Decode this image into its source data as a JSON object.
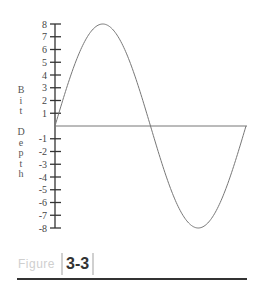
{
  "chart_data": {
    "type": "line",
    "title": "",
    "xlabel": "",
    "ylabel": "Bit Depth",
    "ylim": [
      -8,
      8
    ],
    "yticks": [
      8,
      7,
      6,
      5,
      4,
      3,
      2,
      1,
      -1,
      -2,
      -3,
      -4,
      -5,
      -6,
      -7,
      -8
    ],
    "grid": false,
    "legend": null,
    "series": [
      {
        "name": "sine wave",
        "description": "One full cycle of a sine wave with amplitude 8",
        "x": [
          0,
          0.125,
          0.25,
          0.375,
          0.5,
          0.625,
          0.75,
          0.875,
          1.0
        ],
        "values": [
          0,
          5.66,
          8,
          5.66,
          0,
          -5.66,
          -8,
          -5.66,
          0
        ]
      }
    ],
    "baseline": 0,
    "colors": {
      "wave": "#777777",
      "axis": "#333333",
      "baseline": "#777777"
    }
  },
  "axis": {
    "ylabel_letters": [
      "B",
      "i",
      "t",
      " ",
      "D",
      "e",
      "p",
      "t",
      "h"
    ],
    "tick_labels": [
      "8",
      "7",
      "6",
      "5",
      "4",
      "3",
      "2",
      "1",
      "-1",
      "-2",
      "-3",
      "-4",
      "-5",
      "-6",
      "-7",
      "-8"
    ]
  },
  "caption": {
    "word": "Figure",
    "number": "3-3"
  }
}
